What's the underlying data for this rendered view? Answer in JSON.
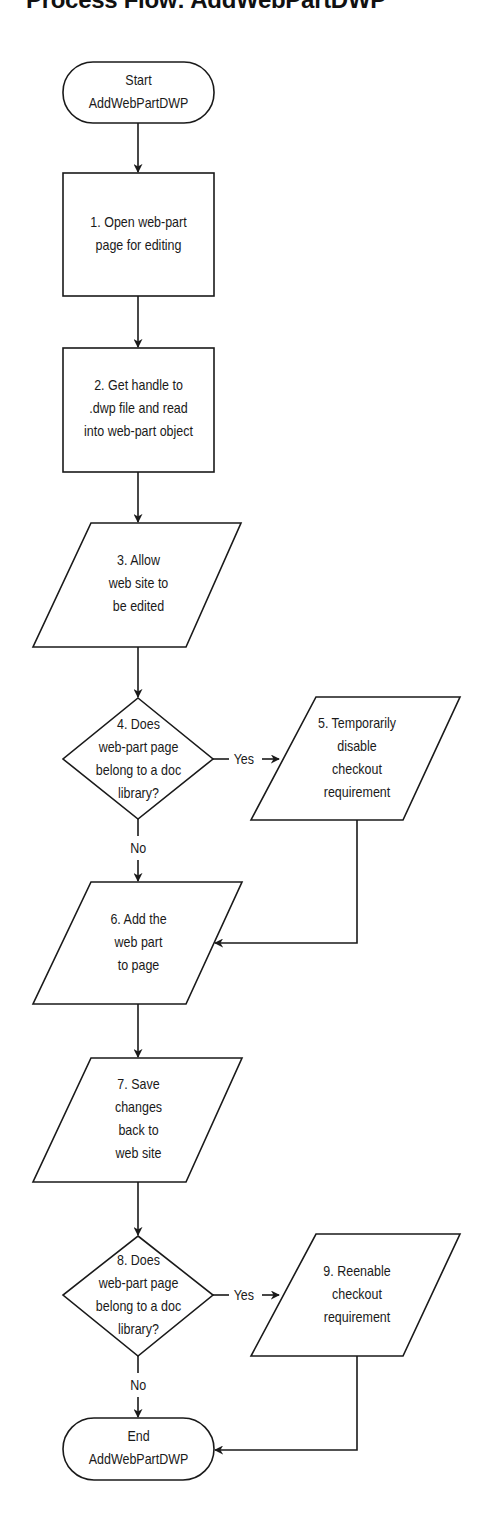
{
  "title": "Process Flow: AddWebPartDWP",
  "nodes": {
    "start": {
      "type": "terminator",
      "text": "Start\nAddWebPartDWP"
    },
    "n1": {
      "type": "process",
      "text": "1. Open web-part\npage for editing"
    },
    "n2": {
      "type": "process",
      "text": "2. Get handle to\n.dwp file and read\ninto web-part object"
    },
    "n3": {
      "type": "io",
      "text": "3. Allow\nweb site to\nbe edited"
    },
    "n4": {
      "type": "decision",
      "text": "4. Does\nweb-part page\nbelong to a doc\nlibrary?"
    },
    "n5": {
      "type": "io",
      "text": "5. Temporarily\ndisable\ncheckout\nrequirement"
    },
    "n6": {
      "type": "io",
      "text": "6. Add the\nweb part\nto page"
    },
    "n7": {
      "type": "io",
      "text": "7. Save\nchanges\nback to\nweb site"
    },
    "n8": {
      "type": "decision",
      "text": "8. Does\nweb-part page\nbelong to a doc\nlibrary?"
    },
    "n9": {
      "type": "io",
      "text": "9. Reenable\ncheckout\nrequirement"
    },
    "end": {
      "type": "terminator",
      "text": "End\nAddWebPartDWP"
    }
  },
  "edges": [
    {
      "from": "start",
      "to": "n1",
      "label": ""
    },
    {
      "from": "n1",
      "to": "n2",
      "label": ""
    },
    {
      "from": "n2",
      "to": "n3",
      "label": ""
    },
    {
      "from": "n3",
      "to": "n4",
      "label": ""
    },
    {
      "from": "n4",
      "to": "n5",
      "label": "Yes"
    },
    {
      "from": "n4",
      "to": "n6",
      "label": "No"
    },
    {
      "from": "n5",
      "to": "n6",
      "label": ""
    },
    {
      "from": "n6",
      "to": "n7",
      "label": ""
    },
    {
      "from": "n7",
      "to": "n8",
      "label": ""
    },
    {
      "from": "n8",
      "to": "n9",
      "label": "Yes"
    },
    {
      "from": "n8",
      "to": "end",
      "label": "No"
    },
    {
      "from": "n9",
      "to": "end",
      "label": ""
    }
  ],
  "edge_labels": {
    "yes1": "Yes",
    "no1": "No",
    "yes2": "Yes",
    "no2": "No"
  },
  "colors": {
    "stroke": "#1a1a1a",
    "background": "#ffffff",
    "text": "#1a1a1a"
  }
}
